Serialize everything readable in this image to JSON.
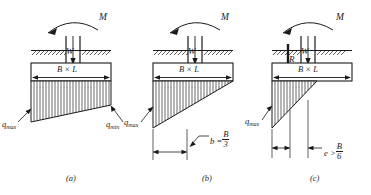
{
  "figure": {
    "type": "engineering-diagram",
    "panels": [
      {
        "id": "a",
        "caption": "(a)",
        "case": "eccentricity less than B/6 — trapezoidal pressure",
        "labels": {
          "moment": "M",
          "load": "W",
          "footing": "B × L",
          "q_max": "q",
          "q_max_sub": "max",
          "q_min": "q",
          "q_min_sub": "min"
        }
      },
      {
        "id": "b",
        "caption": "(b)",
        "case": "eccentricity equal to B/6 — triangular pressure over full width",
        "labels": {
          "moment": "M",
          "load": "W",
          "footing": "B × L",
          "q_max": "q",
          "q_max_sub": "max",
          "b_label": "b =",
          "b_num": "B",
          "b_den": "3"
        }
      },
      {
        "id": "c",
        "caption": "(c)",
        "case": "eccentricity greater than B/6 — partial triangular pressure",
        "labels": {
          "moment": "M",
          "load": "W",
          "resultant": "R",
          "footing": "B × L",
          "q_max": "q",
          "q_max_sub": "max",
          "e_label": "e >",
          "e_num": "B",
          "e_den": "6"
        }
      }
    ],
    "colors": {
      "line": "#1a1a1a",
      "text": "#1a1a1a",
      "caption": "#2b2b2b",
      "background": "#ffffff",
      "footing_fill": "#ffffff",
      "pressure_fill": "#ffffff"
    }
  }
}
